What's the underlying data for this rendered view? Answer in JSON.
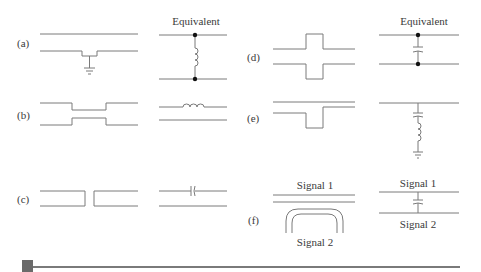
{
  "figure": {
    "header_left": "Equivalent",
    "header_right": "Equivalent",
    "panels": [
      {
        "id": "a",
        "label": "(a)",
        "description": "Stub to ground on lower line; equivalent is a shunt inductor between lines"
      },
      {
        "id": "b",
        "label": "(b)",
        "description": "Narrowed line section; equivalent is a series inductor"
      },
      {
        "id": "c",
        "label": "(c)",
        "description": "Gap in line; equivalent is a series capacitor"
      },
      {
        "id": "d",
        "label": "(d)",
        "description": "Widened section; equivalent is a shunt capacitor between lines"
      },
      {
        "id": "e",
        "label": "(e)",
        "description": "Dip in lower line; equivalent is a series LC to ground"
      },
      {
        "id": "f",
        "label": "(f)",
        "description": "Crossover of two signals; equivalent is coupling capacitor"
      }
    ],
    "signals": {
      "f_left_top": "Signal 1",
      "f_left_bottom": "Signal 2",
      "f_right_top": "Signal 1",
      "f_right_bottom": "Signal 2"
    }
  },
  "colors": {
    "line": "#7a7a7a",
    "dot": "#111111",
    "text": "#3a3a3a",
    "footer": "#6a6a6a"
  }
}
